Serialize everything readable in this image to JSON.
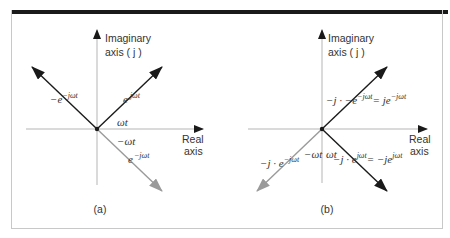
{
  "figure": {
    "panels": [
      {
        "caption": "(a)",
        "axes": {
          "imag_label_1": "Imaginary",
          "imag_label_2": "axis ( j )",
          "real_label_1": "Real",
          "real_label_2": "axis"
        },
        "vectors": [
          {
            "id": "pos",
            "base": "e",
            "exp": "jωt",
            "color": "#1a1a1a",
            "direction": "up-right"
          },
          {
            "id": "neg_minus",
            "prefix": "−e",
            "exp": "−jωt",
            "color": "#1a1a1a",
            "direction": "up-left"
          },
          {
            "id": "neg",
            "base": "e",
            "exp": "−jωt",
            "color": "#9a9a9a",
            "direction": "down-right"
          }
        ],
        "angles": {
          "pos": "ωt",
          "neg": "−ωt"
        }
      },
      {
        "caption": "(b)",
        "axes": {
          "imag_label_1": "Imaginary",
          "imag_label_2": "axis ( j )",
          "real_label_1": "Real",
          "real_label_2": "axis"
        },
        "vectors": [
          {
            "id": "upright",
            "lhs": "−j · −e",
            "lhs_exp": "−jωt",
            "rhs": "= je",
            "rhs_exp": "−jωt",
            "color": "#1a1a1a",
            "direction": "up-right"
          },
          {
            "id": "downright",
            "lhs": "−j · e",
            "lhs_exp": "jωt",
            "rhs": "= −je",
            "rhs_exp": "jωt",
            "color": "#1a1a1a",
            "direction": "down-right"
          },
          {
            "id": "downleft",
            "lhs": "−j · e",
            "lhs_exp": "−jωt",
            "color": "#9a9a9a",
            "direction": "down-left"
          }
        ],
        "angles": {
          "pos": "ωt",
          "neg": "−ωt"
        }
      }
    ]
  }
}
